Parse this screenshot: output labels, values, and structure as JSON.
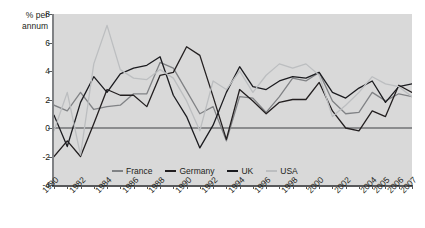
{
  "chart_data": {
    "type": "line",
    "title": "",
    "ylabel": "% per annum",
    "xlabel": "",
    "ylim": [
      -4,
      8
    ],
    "yticks": [
      8,
      6,
      4,
      2,
      0,
      -2,
      -4
    ],
    "grid": false,
    "legend_position": "bottom-inside",
    "zero_line": true,
    "x": [
      1980,
      1981,
      1982,
      1983,
      1984,
      1985,
      1986,
      1987,
      1988,
      1989,
      1990,
      1991,
      1992,
      1993,
      1994,
      1995,
      1996,
      1997,
      1998,
      1999,
      2000,
      2001,
      2002,
      2003,
      2004,
      2005,
      2006,
      2007
    ],
    "xtick_labels": [
      "1980",
      "1982",
      "1984",
      "1986",
      "1988",
      "1990",
      "1992",
      "1994",
      "1996",
      "1998",
      "2000",
      "2002",
      "2004",
      "2005",
      "2006",
      "2007"
    ],
    "xtick_values": [
      1980,
      1982,
      1984,
      1986,
      1988,
      1990,
      1992,
      1994,
      1996,
      1998,
      2000,
      2002,
      2004,
      2005,
      2006,
      2007
    ],
    "series": [
      {
        "name": "France",
        "color": "#808285",
        "values": [
          1.6,
          1.2,
          2.5,
          1.3,
          1.5,
          1.6,
          2.4,
          2.4,
          4.6,
          4.2,
          2.6,
          1.0,
          1.5,
          -0.9,
          2.2,
          2.1,
          1.1,
          2.2,
          3.5,
          3.3,
          3.9,
          1.9,
          1.0,
          1.1,
          2.5,
          1.9,
          2.4,
          2.2
        ]
      },
      {
        "name": "Germany",
        "color": "#231f20",
        "values": [
          -2.0,
          -0.9,
          -2.0,
          0.3,
          2.7,
          2.3,
          2.3,
          1.5,
          3.7,
          3.9,
          5.7,
          5.1,
          2.2,
          -0.8,
          2.7,
          1.9,
          1.0,
          1.8,
          2.0,
          2.0,
          3.2,
          1.2,
          0.0,
          -0.2,
          1.2,
          0.8,
          3.0,
          2.5
        ]
      },
      {
        "name": "UK",
        "color": "#1b1b1f",
        "values": [
          0.9,
          -1.3,
          1.8,
          3.6,
          2.5,
          3.8,
          4.2,
          4.4,
          5.0,
          2.3,
          0.8,
          -1.4,
          0.2,
          2.5,
          4.3,
          2.9,
          2.7,
          3.3,
          3.6,
          3.5,
          3.9,
          2.5,
          2.1,
          2.8,
          3.3,
          1.8,
          2.9,
          3.1
        ]
      },
      {
        "name": "USA",
        "color": "#bcbec0",
        "values": [
          -0.2,
          2.5,
          -1.9,
          4.5,
          7.2,
          4.1,
          3.5,
          3.4,
          4.1,
          3.5,
          1.9,
          -0.2,
          3.3,
          2.7,
          4.0,
          2.5,
          3.7,
          4.5,
          4.2,
          4.5,
          3.7,
          0.8,
          1.6,
          2.5,
          3.6,
          3.1,
          2.9,
          2.2
        ]
      }
    ]
  },
  "legend": {
    "items": [
      {
        "label": "France"
      },
      {
        "label": "Germany"
      },
      {
        "label": "UK"
      },
      {
        "label": "USA"
      }
    ]
  },
  "colors": {
    "plot_background": "#d9d9d9",
    "axis": "#58595b",
    "text": "#231f20",
    "page_background": "#ffffff"
  }
}
